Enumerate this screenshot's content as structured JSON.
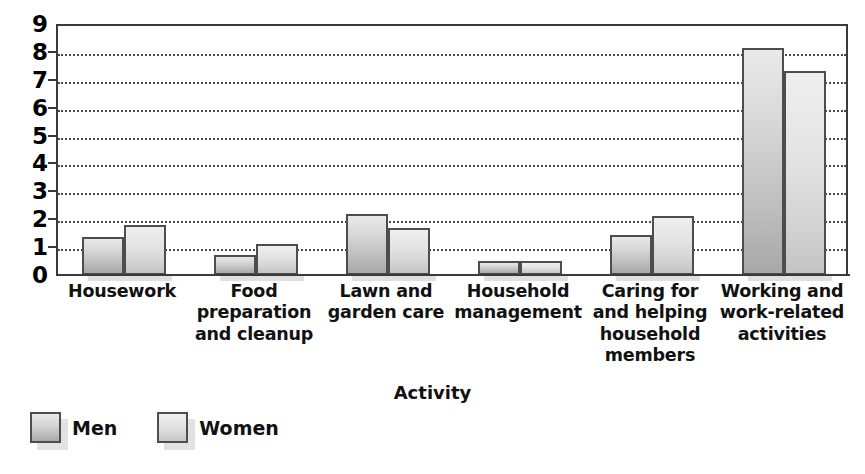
{
  "chart_data": {
    "type": "bar",
    "title": "",
    "xlabel": "Activity",
    "ylabel": "",
    "categories": [
      "Housework",
      "Food preparation and cleanup",
      "Lawn and garden care",
      "Household management",
      "Caring for and helping household members",
      "Working and work-related activities"
    ],
    "category_lines": [
      [
        "Housework"
      ],
      [
        "Food",
        "preparation",
        "and cleanup"
      ],
      [
        "Lawn and",
        "garden care"
      ],
      [
        "Household",
        "management"
      ],
      [
        "Caring for",
        "and helping",
        "household",
        "members"
      ],
      [
        "Working and",
        "work-related",
        "activities"
      ]
    ],
    "series": [
      {
        "name": "Men",
        "color": "#c9c9c9",
        "values": [
          1.35,
          0.7,
          2.2,
          0.5,
          1.45,
          8.15
        ]
      },
      {
        "name": "Women",
        "color": "#dcdcdc",
        "values": [
          1.8,
          1.1,
          1.7,
          0.5,
          2.1,
          7.3
        ]
      }
    ],
    "ylim": [
      0,
      9
    ],
    "y_ticks": [
      "9",
      "8",
      "7",
      "6",
      "5",
      "4",
      "3",
      "2",
      "1",
      "0"
    ],
    "grid": "horizontal-dotted",
    "legend_position": "bottom-left"
  },
  "legend": {
    "items": [
      {
        "label": "Men"
      },
      {
        "label": "Women"
      }
    ]
  },
  "axis": {
    "x_title": "Activity"
  }
}
